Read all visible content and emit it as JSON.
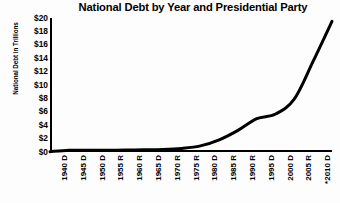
{
  "chart_data": {
    "type": "line",
    "title": "National Debt by Year and Presidential Party",
    "xlabel": "",
    "ylabel": "National Debt in Trillions",
    "grid": false,
    "legend": "none",
    "ylim": [
      0,
      20
    ],
    "ytick_labels": [
      "$20",
      "$18",
      "$16",
      "$14",
      "$12",
      "$10",
      "$8",
      "$6",
      "$4",
      "$2",
      "$0"
    ],
    "ytick_values": [
      20,
      18,
      16,
      14,
      12,
      10,
      8,
      6,
      4,
      2,
      0
    ],
    "categories": [
      "1940 D",
      "1945 D",
      "1950 D",
      "1955 R",
      "1960 R",
      "1965 D",
      "1970 R",
      "1975 R",
      "1980 D",
      "1985 R",
      "1990 R",
      "1995 D",
      "2000 D",
      "2005 R",
      "*2010 D",
      "*2015 ?"
    ],
    "years": [
      1940,
      1945,
      1950,
      1955,
      1960,
      1965,
      1970,
      1975,
      1980,
      1985,
      1990,
      1995,
      2000,
      2005,
      2010,
      2015
    ],
    "parties": [
      "D",
      "D",
      "D",
      "R",
      "R",
      "D",
      "R",
      "R",
      "D",
      "R",
      "R",
      "D",
      "D",
      "R",
      "D",
      "?"
    ],
    "values": [
      0.05,
      0.26,
      0.26,
      0.27,
      0.29,
      0.32,
      0.37,
      0.53,
      0.91,
      1.82,
      3.23,
      4.97,
      5.67,
      7.93,
      13.56,
      19.5
    ],
    "series": [
      {
        "name": "National Debt",
        "values": [
          0.05,
          0.26,
          0.26,
          0.27,
          0.29,
          0.32,
          0.37,
          0.53,
          0.91,
          1.82,
          3.23,
          4.97,
          5.67,
          7.93,
          13.56,
          19.5
        ]
      }
    ],
    "line_color": "#000000",
    "line_width": 3,
    "annotations": [
      "* denotes projected or estimated value"
    ]
  }
}
